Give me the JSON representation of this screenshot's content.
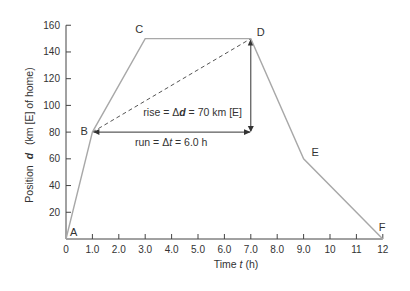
{
  "chart_data": {
    "type": "line",
    "title": "",
    "xlabel": "Time t (h)",
    "ylabel": "Position d (km [E] of home)",
    "xlim": [
      0,
      12
    ],
    "ylim": [
      0,
      160
    ],
    "grid": false,
    "x_ticks": [
      "0",
      "1.0",
      "2.0",
      "3.0",
      "4.0",
      "5.0",
      "6.0",
      "7.0",
      "8.0",
      "9.0",
      "10",
      "11",
      "12"
    ],
    "y_ticks": [
      "20",
      "40",
      "60",
      "80",
      "100",
      "120",
      "140",
      "160"
    ],
    "series": [
      {
        "name": "position-time",
        "points": [
          {
            "label": "A",
            "x": 0,
            "y": 0
          },
          {
            "label": "B",
            "x": 1.0,
            "y": 80
          },
          {
            "label": "C",
            "x": 3.0,
            "y": 150
          },
          {
            "label": "D",
            "x": 7.0,
            "y": 150
          },
          {
            "label": "E",
            "x": 9.0,
            "y": 60
          },
          {
            "label": "F",
            "x": 12,
            "y": 0
          }
        ]
      }
    ],
    "annotations": {
      "secant": {
        "from": "B",
        "to": "D",
        "style": "dashed"
      },
      "rise_label": "rise = Δd = 70 km [E]",
      "run_label": "run = Δt = 6.0 h"
    }
  },
  "labels": {
    "x_axis_title_prefix": "Time ",
    "x_axis_title_var": "t",
    "x_axis_title_suffix": " (h)",
    "y_axis_title_prefix": "Position",
    "y_axis_title_var": "d",
    "y_axis_title_suffix": "(km [E] of home)",
    "rise_prefix": "rise = Δ",
    "rise_var": "d",
    "rise_suffix": " = 70 km [E]",
    "run_prefix": "run = Δ",
    "run_var": "t",
    "run_suffix": " = 6.0 h"
  }
}
